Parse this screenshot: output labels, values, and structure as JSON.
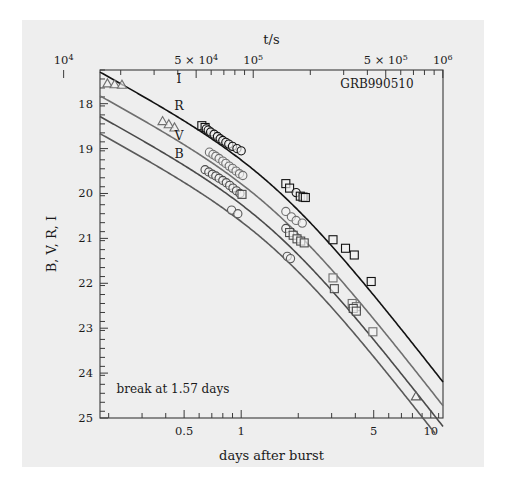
{
  "figure": {
    "object_label": "GRB990510",
    "break_annotation": "break at 1.57 days"
  },
  "chart_data": {
    "type": "line",
    "title": "",
    "xlabel": "days after burst",
    "ylabel": "B, V, R, I",
    "top_axis_label": "t/s",
    "xscale": "log",
    "yscale": "linear-inverted",
    "xlim": [
      0.18,
      11.6
    ],
    "ylim": [
      25,
      17.25
    ],
    "top_xlim": [
      10000,
      1002240
    ],
    "grid": false,
    "legend": "inline-curve-labels",
    "annotations": [
      {
        "text": "GRB990510",
        "x": 5.2,
        "y": 17.65
      },
      {
        "text": "break at 1.57 days",
        "x": 0.22,
        "y": 24.45
      }
    ],
    "x_ticks": [
      {
        "value": 0.5,
        "label": "0.5"
      },
      {
        "value": 1,
        "label": "1"
      },
      {
        "value": 5,
        "label": "5"
      },
      {
        "value": 10,
        "label": "10"
      }
    ],
    "x_minor_ticks": [
      0.2,
      0.3,
      0.4,
      0.6,
      0.7,
      0.8,
      0.9,
      2,
      3,
      4,
      6,
      7,
      8,
      9,
      11
    ],
    "y_ticks": [
      {
        "value": 18,
        "label": "18"
      },
      {
        "value": 19,
        "label": "19"
      },
      {
        "value": 20,
        "label": "20"
      },
      {
        "value": 21,
        "label": "21"
      },
      {
        "value": 22,
        "label": "22"
      },
      {
        "value": 23,
        "label": "23"
      },
      {
        "value": 24,
        "label": "24"
      },
      {
        "value": 25,
        "label": "25"
      }
    ],
    "y_minor_step": 0.2,
    "top_ticks": [
      {
        "value": 10000,
        "label": "10",
        "sup": "4"
      },
      {
        "value": 50000,
        "label": "5 × 10",
        "sup": "4"
      },
      {
        "value": 100000,
        "label": "10",
        "sup": "5"
      },
      {
        "value": 500000,
        "label": "5 × 10",
        "sup": "5"
      },
      {
        "value": 1000000,
        "label": "10",
        "sup": "6"
      }
    ],
    "top_minor_ticks": [
      20000,
      30000,
      40000,
      60000,
      70000,
      80000,
      90000,
      200000,
      300000,
      400000,
      600000,
      700000,
      800000,
      900000
    ],
    "break_time_days": 1.57,
    "series": [
      {
        "name": "I",
        "color": "#121212",
        "label_x": 0.47,
        "label_y": 17.55,
        "model": {
          "mag_at_break": 19.95,
          "alpha1": 0.92,
          "alpha2": 2.18,
          "smooth": 1.5
        },
        "points": [
          {
            "x": 0.62,
            "y": 18.49,
            "marker": "square"
          },
          {
            "x": 0.645,
            "y": 18.53,
            "marker": "square"
          },
          {
            "x": 0.655,
            "y": 18.56,
            "marker": "circle"
          },
          {
            "x": 0.67,
            "y": 18.59,
            "marker": "circle"
          },
          {
            "x": 0.69,
            "y": 18.63,
            "marker": "circle"
          },
          {
            "x": 0.72,
            "y": 18.68,
            "marker": "circle"
          },
          {
            "x": 0.75,
            "y": 18.73,
            "marker": "circle"
          },
          {
            "x": 0.775,
            "y": 18.78,
            "marker": "circle"
          },
          {
            "x": 0.8,
            "y": 18.82,
            "marker": "circle"
          },
          {
            "x": 0.83,
            "y": 18.86,
            "marker": "circle"
          },
          {
            "x": 0.86,
            "y": 18.9,
            "marker": "circle"
          },
          {
            "x": 0.9,
            "y": 18.95,
            "marker": "circle"
          },
          {
            "x": 0.95,
            "y": 19.0,
            "marker": "circle"
          },
          {
            "x": 1.0,
            "y": 19.05,
            "marker": "circle"
          },
          {
            "x": 1.72,
            "y": 19.78,
            "marker": "square"
          },
          {
            "x": 1.8,
            "y": 19.88,
            "marker": "square"
          },
          {
            "x": 1.95,
            "y": 19.98,
            "marker": "circle"
          },
          {
            "x": 2.05,
            "y": 20.06,
            "marker": "square"
          },
          {
            "x": 2.12,
            "y": 20.08,
            "marker": "square"
          },
          {
            "x": 2.18,
            "y": 20.09,
            "marker": "square"
          },
          {
            "x": 3.05,
            "y": 21.03,
            "marker": "square"
          },
          {
            "x": 3.55,
            "y": 21.22,
            "marker": "square"
          },
          {
            "x": 3.95,
            "y": 21.37,
            "marker": "square"
          },
          {
            "x": 4.85,
            "y": 21.96,
            "marker": "square"
          }
        ]
      },
      {
        "name": "R",
        "color": "#6f6f6f",
        "label_x": 0.47,
        "label_y": 18.14,
        "model": {
          "mag_at_break": 20.48,
          "alpha1": 0.92,
          "alpha2": 2.18,
          "smooth": 1.5
        },
        "points": [
          {
            "x": 0.197,
            "y": 17.55,
            "marker": "triangle"
          },
          {
            "x": 0.215,
            "y": 17.57,
            "marker": "triangle"
          },
          {
            "x": 0.235,
            "y": 17.58,
            "marker": "triangle"
          },
          {
            "x": 0.385,
            "y": 18.39,
            "marker": "triangle"
          },
          {
            "x": 0.415,
            "y": 18.46,
            "marker": "triangle"
          },
          {
            "x": 0.445,
            "y": 18.53,
            "marker": "triangle"
          },
          {
            "x": 0.68,
            "y": 19.08,
            "marker": "circle"
          },
          {
            "x": 0.71,
            "y": 19.13,
            "marker": "circle"
          },
          {
            "x": 0.735,
            "y": 19.17,
            "marker": "circle"
          },
          {
            "x": 0.765,
            "y": 19.22,
            "marker": "circle"
          },
          {
            "x": 0.8,
            "y": 19.28,
            "marker": "circle"
          },
          {
            "x": 0.83,
            "y": 19.33,
            "marker": "circle"
          },
          {
            "x": 0.865,
            "y": 19.39,
            "marker": "circle"
          },
          {
            "x": 0.9,
            "y": 19.44,
            "marker": "circle"
          },
          {
            "x": 0.94,
            "y": 19.5,
            "marker": "circle"
          },
          {
            "x": 0.98,
            "y": 19.56,
            "marker": "circle"
          },
          {
            "x": 1.02,
            "y": 19.6,
            "marker": "circle"
          },
          {
            "x": 1.72,
            "y": 20.4,
            "marker": "circle"
          },
          {
            "x": 1.84,
            "y": 20.52,
            "marker": "circle"
          },
          {
            "x": 1.95,
            "y": 20.6,
            "marker": "circle"
          },
          {
            "x": 2.1,
            "y": 20.66,
            "marker": "circle"
          },
          {
            "x": 3.05,
            "y": 21.88,
            "marker": "square"
          },
          {
            "x": 3.85,
            "y": 22.45,
            "marker": "square"
          },
          {
            "x": 4.05,
            "y": 22.52,
            "marker": "square"
          },
          {
            "x": 4.95,
            "y": 23.08,
            "marker": "square"
          }
        ]
      },
      {
        "name": "V",
        "color": "#4a4a4a",
        "label_x": 0.47,
        "label_y": 18.8,
        "model": {
          "mag_at_break": 20.94,
          "alpha1": 0.92,
          "alpha2": 2.18,
          "smooth": 1.5
        },
        "points": [
          {
            "x": 0.645,
            "y": 19.47,
            "marker": "circle"
          },
          {
            "x": 0.675,
            "y": 19.52,
            "marker": "circle"
          },
          {
            "x": 0.705,
            "y": 19.57,
            "marker": "circle"
          },
          {
            "x": 0.735,
            "y": 19.61,
            "marker": "circle"
          },
          {
            "x": 0.765,
            "y": 19.66,
            "marker": "circle"
          },
          {
            "x": 0.8,
            "y": 19.71,
            "marker": "circle"
          },
          {
            "x": 0.835,
            "y": 19.76,
            "marker": "circle"
          },
          {
            "x": 0.87,
            "y": 19.82,
            "marker": "circle"
          },
          {
            "x": 0.905,
            "y": 19.88,
            "marker": "circle"
          },
          {
            "x": 0.945,
            "y": 19.94,
            "marker": "circle"
          },
          {
            "x": 0.985,
            "y": 20.0,
            "marker": "circle"
          },
          {
            "x": 1.01,
            "y": 20.02,
            "marker": "square"
          },
          {
            "x": 1.72,
            "y": 20.78,
            "marker": "circle"
          },
          {
            "x": 1.8,
            "y": 20.87,
            "marker": "square"
          },
          {
            "x": 1.88,
            "y": 20.93,
            "marker": "square"
          },
          {
            "x": 1.97,
            "y": 21.01,
            "marker": "square"
          },
          {
            "x": 2.06,
            "y": 21.06,
            "marker": "square"
          },
          {
            "x": 2.15,
            "y": 21.1,
            "marker": "square"
          },
          {
            "x": 3.1,
            "y": 22.12,
            "marker": "square"
          },
          {
            "x": 3.9,
            "y": 22.56,
            "marker": "square"
          },
          {
            "x": 4.05,
            "y": 22.62,
            "marker": "square"
          }
        ]
      },
      {
        "name": "B",
        "color": "#5a5a5a",
        "label_x": 0.47,
        "label_y": 19.22,
        "model": {
          "mag_at_break": 21.32,
          "alpha1": 0.92,
          "alpha2": 2.18,
          "smooth": 1.5
        },
        "points": [
          {
            "x": 0.89,
            "y": 20.37,
            "marker": "circle"
          },
          {
            "x": 0.96,
            "y": 20.45,
            "marker": "circle"
          },
          {
            "x": 1.75,
            "y": 21.4,
            "marker": "circle"
          },
          {
            "x": 1.82,
            "y": 21.45,
            "marker": "circle"
          },
          {
            "x": 8.35,
            "y": 24.52,
            "marker": "triangle"
          }
        ]
      }
    ]
  }
}
